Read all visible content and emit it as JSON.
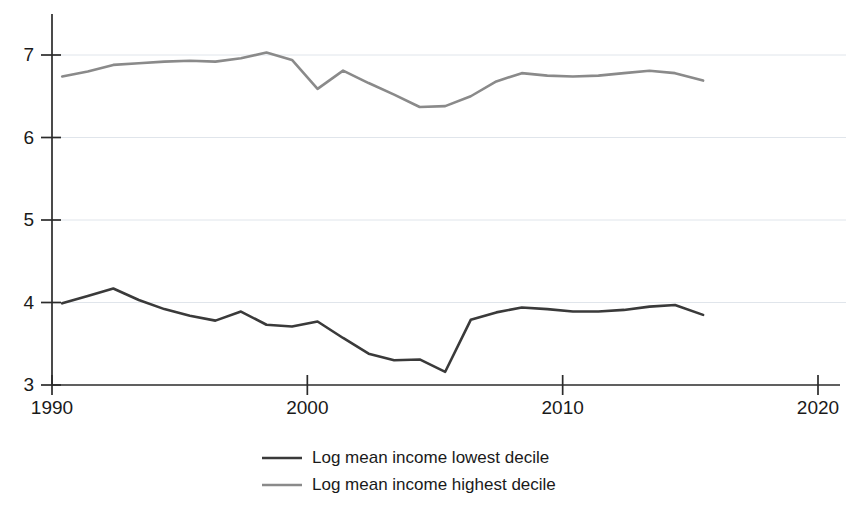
{
  "chart_data": {
    "type": "line",
    "title": "",
    "subtitle": "",
    "xlabel": "",
    "ylabel": "",
    "xlim": [
      1990,
      2020
    ],
    "ylim": [
      3,
      7.35
    ],
    "xticks": [
      1990,
      2000,
      2010,
      2020
    ],
    "xtick_labels": [
      "1990",
      "2000",
      "2010",
      "2020"
    ],
    "yticks": [
      3,
      4,
      5,
      6,
      7
    ],
    "ytick_labels": [
      "3",
      "4",
      "5",
      "6",
      "7"
    ],
    "grid": "horizontal",
    "legend_position": "bottom-center",
    "series": [
      {
        "name": "Log mean income lowest decile",
        "color": "#3a3a3a",
        "x": [
          1990.4,
          1991.4,
          1992.4,
          1993.4,
          1994.4,
          1995.4,
          1996.4,
          1997.4,
          1998.4,
          1999.4,
          2000.4,
          2001.4,
          2002.4,
          2003.4,
          2004.4,
          2005.4,
          2006.4,
          2007.4,
          2008.4,
          2009.4,
          2010.4,
          2011.4,
          2012.4,
          2013.4,
          2014.4,
          2015.5
        ],
        "values": [
          3.99,
          4.08,
          4.17,
          4.03,
          3.92,
          3.84,
          3.78,
          3.89,
          3.73,
          3.71,
          3.77,
          3.57,
          3.38,
          3.3,
          3.31,
          3.16,
          3.79,
          3.88,
          3.94,
          3.92,
          3.89,
          3.89,
          3.91,
          3.95,
          3.97,
          3.85
        ]
      },
      {
        "name": "Log mean income highest decile",
        "color": "#8a8a8a",
        "x": [
          1990.4,
          1991.4,
          1992.4,
          1993.4,
          1994.4,
          1995.4,
          1996.4,
          1997.4,
          1998.4,
          1999.4,
          2000.4,
          2001.4,
          2002.4,
          2003.4,
          2004.4,
          2005.4,
          2006.4,
          2007.4,
          2008.4,
          2009.4,
          2010.4,
          2011.4,
          2012.4,
          2013.4,
          2014.4,
          2015.5
        ],
        "values": [
          6.74,
          6.8,
          6.88,
          6.9,
          6.92,
          6.93,
          6.92,
          6.96,
          7.03,
          6.94,
          6.59,
          6.81,
          6.66,
          6.52,
          6.37,
          6.38,
          6.5,
          6.68,
          6.78,
          6.75,
          6.74,
          6.75,
          6.78,
          6.81,
          6.78,
          6.69
        ]
      }
    ],
    "legend": [
      {
        "label": "Log mean income lowest decile",
        "color": "#3a3a3a"
      },
      {
        "label": "Log mean income highest decile",
        "color": "#8a8a8a"
      }
    ]
  },
  "colors": {
    "background": "#ffffff",
    "axis": "#2b2b2b",
    "grid": "#d8dee6",
    "lowest_decile": "#3a3a3a",
    "highest_decile": "#8a8a8a",
    "text": "#1a1a1a"
  }
}
